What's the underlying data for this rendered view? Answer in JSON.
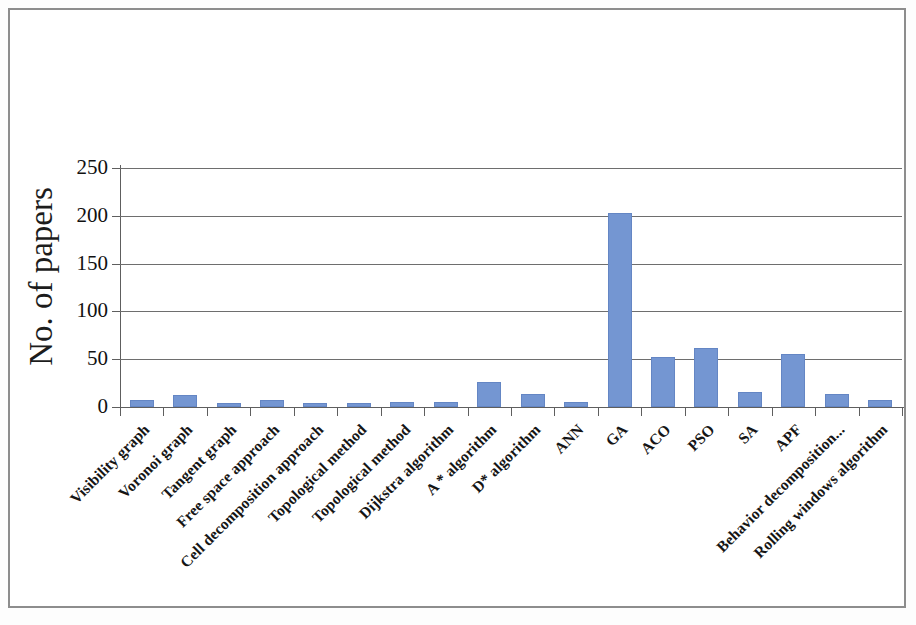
{
  "figure": {
    "background_color": "#ffffff",
    "border_color": "#8d8d8d",
    "bar_color": "#7496d2",
    "axis_color": "#5e5e5e",
    "gridline_color": "#6e6e6e"
  },
  "chart_data": {
    "type": "bar",
    "title": "",
    "xlabel": "",
    "ylabel": "No. of papers",
    "ylim": [
      0,
      250
    ],
    "yticks": [
      0,
      50,
      100,
      150,
      200,
      250
    ],
    "ytick_labels": [
      "0",
      "50",
      "100",
      "150",
      "200",
      "250"
    ],
    "grid": true,
    "legend": false,
    "orientation": "vertical",
    "categories": [
      "Visibility graph",
      "Voronoi graph",
      "Tangent graph",
      "Free space approach",
      "Cell decomposition approach",
      "Topological method",
      "Topological method",
      "Dijkstra algorithm",
      "A * algorithm",
      "D* algorithm",
      "ANN",
      "GA",
      "ACO",
      "PSO",
      "SA",
      "APF",
      "Behavior decomposition...",
      "Rolling windows algorithm"
    ],
    "values": [
      7,
      13,
      4,
      7,
      4,
      4,
      5,
      5,
      26,
      14,
      5,
      203,
      52,
      62,
      16,
      55,
      14,
      7
    ]
  }
}
